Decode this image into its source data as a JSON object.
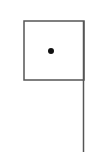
{
  "diagram": {
    "colors": {
      "background": "#ffffff",
      "stroke": "#555555",
      "dot": "#111111"
    },
    "box": {
      "x": 24,
      "y": 21,
      "width": 60,
      "height": 59
    },
    "dot": {
      "cx": 51,
      "cy": 51,
      "r": 3
    },
    "pole": {
      "x": 83.5,
      "y1": 21,
      "y2": 152
    }
  }
}
